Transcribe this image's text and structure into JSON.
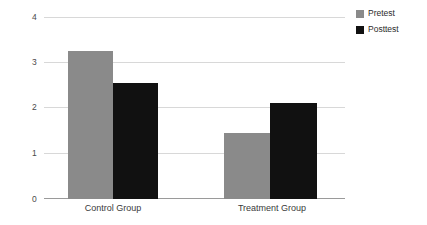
{
  "chart_data": {
    "type": "bar",
    "title": "",
    "subtitle": "",
    "xlabel": "",
    "ylabel": "",
    "categories": [
      "Control Group",
      "Treatment Group"
    ],
    "series": [
      {
        "name": "Pretest",
        "color": "#8a8a8a",
        "values": [
          3.25,
          1.45
        ]
      },
      {
        "name": "Posttest",
        "color": "#111111",
        "values": [
          2.55,
          2.1
        ]
      }
    ],
    "ylim": [
      0,
      4
    ],
    "yticks": [
      0,
      1,
      2,
      3,
      4
    ],
    "ytick_labels": [
      "0",
      "1",
      "2",
      "3",
      "4"
    ],
    "grid": true,
    "grid_axis": "y",
    "legend_position": "right-top",
    "legend_entries": [
      "Pretest",
      "Posttest"
    ],
    "background_color": "#ffffff",
    "gridline_color": "#d8d8d8",
    "axis_color": "#9a9a9a"
  },
  "axis": {
    "y_tick_0": "0",
    "y_tick_1": "1",
    "y_tick_2": "2",
    "y_tick_3": "3",
    "y_tick_4": "4"
  },
  "categories": {
    "cat_0": "Control Group",
    "cat_1": "Treatment Group"
  },
  "legend": {
    "item_0_label": "Pretest",
    "item_1_label": "Posttest"
  }
}
